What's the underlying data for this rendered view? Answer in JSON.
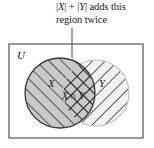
{
  "figure": {
    "caption": {
      "line1_part1": "|",
      "line1_x": "X",
      "line1_part2": "| + |",
      "line1_y": "Y",
      "line1_part3": "| adds this",
      "line2": "region twice",
      "full_text": "|X| + |Y| adds this region twice"
    },
    "universe_label": "U",
    "set_left_label": "X",
    "set_right_label": "Y",
    "intersection_label_x": "X",
    "intersection_label_op": "∩",
    "intersection_label_y": "Y",
    "intersection_label_full": "X ∩ Y",
    "colors": {
      "ink": "#1a1a1a",
      "box_border": "#6e6e6e",
      "circle_left_fill": "#c9c9c9",
      "circle_right_fill": "#f2f2f2",
      "circle_stroke_left": "#3a3a3a",
      "circle_stroke_right": "#c2c2c2",
      "hatch": "#2b2b2b",
      "background": "#ffffff"
    },
    "geometry": {
      "box_x": 9,
      "box_y": 44,
      "box_w": 134,
      "box_h": 94,
      "circle_left_cx": 60,
      "circle_left_cy": 93,
      "circle_left_r": 35,
      "circle_right_cx": 96,
      "circle_right_cy": 93,
      "circle_right_r": 33,
      "leader_x": 72,
      "leader_y_top": 28,
      "leader_y_bottom": 58
    }
  }
}
